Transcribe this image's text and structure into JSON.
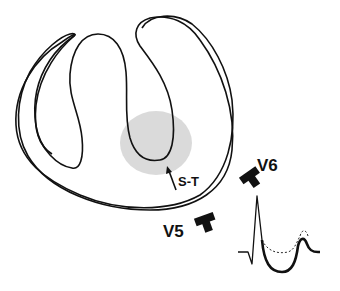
{
  "diagram": {
    "labels": {
      "st": "S-T",
      "v5": "V5",
      "v6": "V6"
    },
    "elements": {
      "outer_wall": "left-ventricle-outer-contour",
      "rv_cavity": "right-ventricle-cavity",
      "mid_cavity": "septal-cavity-loop",
      "lv_cavity": "left-ventricle-cavity",
      "injury_zone": "shaded-injury-region",
      "st_arrow": "arrow-pointing-to-injury",
      "electrode_v5": "electrode-v5",
      "electrode_v6": "electrode-v6",
      "ecg_trace": "ecg-waveform-st-depression"
    },
    "ecg": {
      "solid_trace": "ST-segment depression",
      "dashed_trace": "normal baseline ST"
    },
    "colors": {
      "line": "#111111",
      "injury_zone": "#d6d6d6",
      "background": "#ffffff"
    }
  }
}
